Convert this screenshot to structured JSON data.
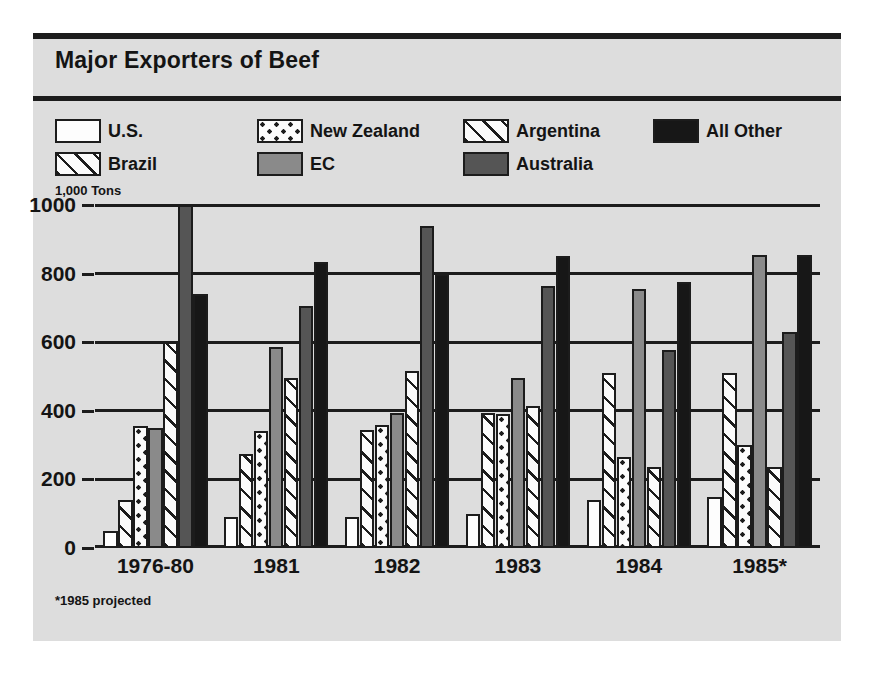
{
  "figure": {
    "title": "Major Exporters of Beef",
    "units_label": "1,000 Tons",
    "footnote": "*1985 projected"
  },
  "legend": {
    "items": [
      {
        "label": "U.S.",
        "key": "us",
        "pattern": "solid-white"
      },
      {
        "label": "Brazil",
        "key": "brazil",
        "pattern": "diagonal-hatch"
      },
      {
        "label": "New Zealand",
        "key": "nz",
        "pattern": "dotted-checker"
      },
      {
        "label": "EC",
        "key": "ec",
        "pattern": "solid-medium-gray"
      },
      {
        "label": "Argentina",
        "key": "argentina",
        "pattern": "diagonal-hatch"
      },
      {
        "label": "Australia",
        "key": "australia",
        "pattern": "solid-dark-gray"
      },
      {
        "label": "All Other",
        "key": "allother",
        "pattern": "solid-black"
      }
    ]
  },
  "colors": {
    "panel_background": "#dddddd",
    "ink": "#1c1c1c",
    "us": "#fdfdfd",
    "ec": "#8a8a8a",
    "australia": "#555555",
    "allother": "#171717"
  },
  "chart_data": {
    "type": "bar",
    "title": "Major Exporters of Beef",
    "xlabel": "",
    "ylabel": "1,000 Tons",
    "ylim": [
      0,
      1000
    ],
    "yticks": [
      0,
      200,
      400,
      600,
      800,
      1000
    ],
    "grid": true,
    "legend_position": "top",
    "categories": [
      "1976-80",
      "1981",
      "1982",
      "1983",
      "1984",
      "1985*"
    ],
    "series": [
      {
        "name": "U.S.",
        "key": "us",
        "values": [
          50,
          90,
          90,
          100,
          140,
          150
        ]
      },
      {
        "name": "Brazil",
        "key": "brazil",
        "values": [
          140,
          275,
          345,
          395,
          510,
          510
        ]
      },
      {
        "name": "New Zealand",
        "key": "nz",
        "values": [
          355,
          340,
          360,
          390,
          265,
          300
        ]
      },
      {
        "name": "EC",
        "key": "ec",
        "values": [
          350,
          585,
          395,
          495,
          755,
          855
        ]
      },
      {
        "name": "Argentina",
        "key": "argentina",
        "values": [
          600,
          495,
          515,
          415,
          235,
          235
        ]
      },
      {
        "name": "Australia",
        "key": "australia",
        "values": [
          1000,
          705,
          940,
          765,
          578,
          630
        ]
      },
      {
        "name": "All Other",
        "key": "allother",
        "values": [
          740,
          835,
          800,
          850,
          775,
          855
        ]
      }
    ],
    "annotations": [
      "*1985 projected"
    ]
  }
}
